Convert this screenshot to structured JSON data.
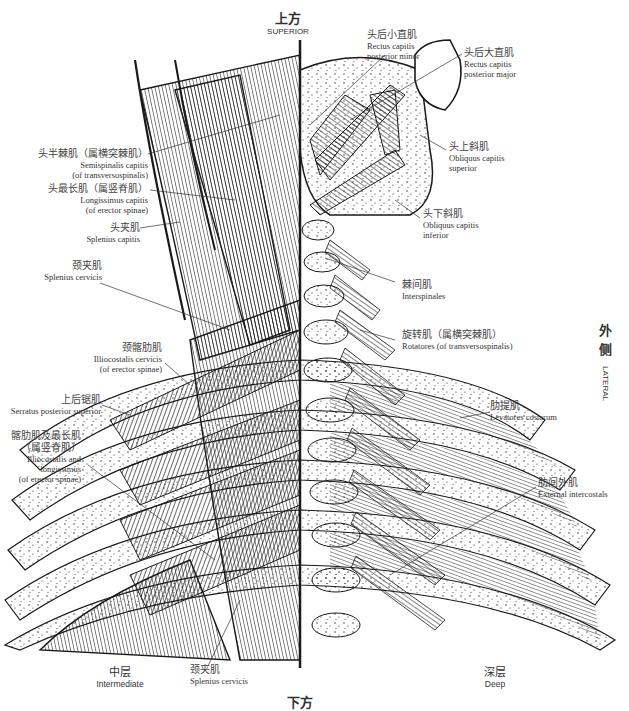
{
  "directions": {
    "superior": {
      "zh": "上方",
      "en": "SUPERIOR"
    },
    "lateral": {
      "zh_1": "外",
      "zh_2": "侧",
      "en": "LATERAL"
    },
    "inferior": {
      "zh": "下方"
    }
  },
  "layers": {
    "intermediate": {
      "zh": "中层",
      "en": "Intermediate"
    },
    "deep": {
      "zh": "深层",
      "en": "Deep"
    }
  },
  "left_labels": [
    {
      "zh": "头半棘肌（属横突棘肌）",
      "en_1": "Semispinalis capitis",
      "en_2": "(of transversospinalis)"
    },
    {
      "zh": "头最长肌（属竖脊肌）",
      "en_1": "Longissimus capitis",
      "en_2": "(of erector spinae)"
    },
    {
      "zh": "头夹肌",
      "en_1": "Splenius capitis"
    },
    {
      "zh": "颈夹肌",
      "en_1": "Splenius cervicis"
    },
    {
      "zh": "颈髂肋肌",
      "en_1": "Illiocostalis cervicis",
      "en_2": "(of erector spinae)"
    },
    {
      "zh": "上后锯肌",
      "en_1": "Serratus posterior superior"
    },
    {
      "zh": "髂肋肌及最长肌",
      "zh_2": "（属竖脊肌）",
      "en_1": "Illiocostalis and",
      "en_2": "longissimus",
      "en_3": "(of erector spinae)"
    },
    {
      "zh": "颈夹肌",
      "en_1": "Splenius cervicis"
    }
  ],
  "right_labels": [
    {
      "zh": "头后小直肌",
      "en_1": "Rectus capitis",
      "en_2": "posterior minor"
    },
    {
      "zh": "头后大直肌",
      "en_1": "Rectus capitis",
      "en_2": "posterior major"
    },
    {
      "zh": "头上斜肌",
      "en_1": "Obliquus capitis",
      "en_2": "superior"
    },
    {
      "zh": "头下斜肌",
      "en_1": "Obliquus capitis",
      "en_2": "inferior"
    },
    {
      "zh": "棘间肌",
      "en_1": "Interspinales"
    },
    {
      "zh": "旋转肌（属横突棘肌）",
      "en_1": "Rotatores (of transversospinalis)"
    },
    {
      "zh": "肋提肌",
      "en_1": "Levatores costarum"
    },
    {
      "zh": "肋间外肌",
      "en_1": "External intercostals"
    }
  ],
  "colors": {
    "ink": "#1a1a1a",
    "text": "#333333",
    "background": "#ffffff"
  }
}
